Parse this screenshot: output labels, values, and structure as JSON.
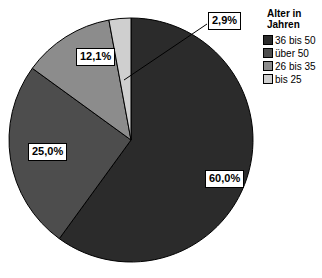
{
  "chart_data": {
    "type": "pie",
    "title": "",
    "legend_title": "Alter in Jahren",
    "legend_position": "right",
    "grid": false,
    "categories": [
      "36 bis 50",
      "über 50",
      "26 bis 35",
      "bis 25"
    ],
    "values": [
      60.0,
      25.0,
      12.1,
      2.9
    ],
    "value_labels": [
      "60,0%",
      "25,0%",
      "12,1%",
      "2,9%"
    ],
    "colors": [
      "#2b2b2b",
      "#4d4d4d",
      "#8c8c8c",
      "#cfcfcf"
    ],
    "start_angle_deg": 0,
    "direction": "clockwise",
    "slices": [
      {
        "label": "36 bis 50",
        "value": 60.0,
        "display": "60,0%",
        "color": "#2b2b2b",
        "label_placement": "inside"
      },
      {
        "label": "über 50",
        "value": 25.0,
        "display": "25,0%",
        "color": "#4d4d4d",
        "label_placement": "inside"
      },
      {
        "label": "26 bis 35",
        "value": 12.1,
        "display": "12,1%",
        "color": "#8c8c8c",
        "label_placement": "inside"
      },
      {
        "label": "bis 25",
        "value": 2.9,
        "display": "2,9%",
        "color": "#cfcfcf",
        "label_placement": "outside-leader"
      }
    ]
  },
  "legend": {
    "title_line1": "Alter in",
    "title_line2": "Jahren",
    "title": "Alter in\nJahren",
    "items": [
      {
        "label": "36 bis 50",
        "color": "#2b2b2b"
      },
      {
        "label": "über 50",
        "color": "#4d4d4d"
      },
      {
        "label": "26 bis 35",
        "color": "#8c8c8c"
      },
      {
        "label": "bis 25",
        "color": "#cfcfcf"
      }
    ]
  },
  "labels": {
    "slice_60": "60,0%",
    "slice_25": "25,0%",
    "slice_12": "12,1%",
    "slice_3": "2,9%"
  },
  "colors": {
    "slice_36_bis_50": "#2b2b2b",
    "slice_ueber_50": "#4d4d4d",
    "slice_26_bis_35": "#8c8c8c",
    "slice_bis_25": "#cfcfcf",
    "outline": "#000000",
    "label_background": "#ffffff",
    "background": "#ffffff"
  }
}
